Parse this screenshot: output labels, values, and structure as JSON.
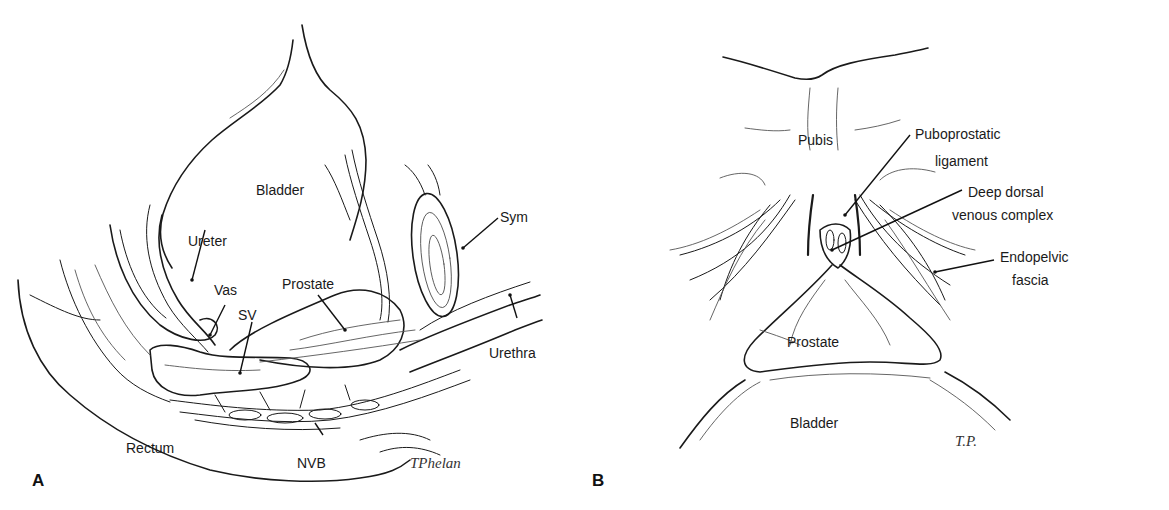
{
  "figure": {
    "panels": [
      {
        "id": "A",
        "label": "A",
        "view": "sagittal",
        "structures": {
          "bladder": "Bladder",
          "ureter": "Ureter",
          "vas": "Vas",
          "sv": "SV",
          "prostate": "Prostate",
          "sym": "Sym",
          "urethra": "Urethra",
          "rectum": "Rectum",
          "nvb": "NVB"
        },
        "signature": "TPhelan"
      },
      {
        "id": "B",
        "label": "B",
        "view": "anterior",
        "structures": {
          "pubis": "Pubis",
          "puboprostatic_line1": "Puboprostatic",
          "puboprostatic_line2": "ligament",
          "ddvc_line1": "Deep dorsal",
          "ddvc_line2": "venous complex",
          "endopelvic_line1": "Endopelvic",
          "endopelvic_line2": "fascia",
          "prostate": "Prostate",
          "bladder": "Bladder"
        },
        "signature": "T.P."
      }
    ]
  }
}
